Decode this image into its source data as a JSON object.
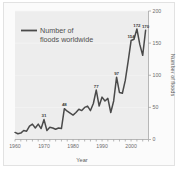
{
  "chart_data": {
    "type": "line",
    "title": "",
    "xlabel": "Year",
    "ylabel": "Number of floods",
    "xlim": [
      1960,
      2006
    ],
    "ylim": [
      0,
      200
    ],
    "grid": false,
    "legend_position": "top-left",
    "legend": [
      "Number of floods worldwide"
    ],
    "legend_line1": "Number of",
    "legend_line2": "floods worldwide",
    "xticks": [
      "1960",
      "1970",
      "1980",
      "1990",
      "2000"
    ],
    "xtick_values": [
      1960,
      1970,
      1980,
      1990,
      2000
    ],
    "yticks": [
      "0",
      "50",
      "100",
      "150",
      "200"
    ],
    "ytick_values": [
      0,
      50,
      100,
      150,
      200
    ],
    "series": [
      {
        "name": "Number of floods worldwide",
        "color": "#4a4a4a",
        "x": [
          1960,
          1961,
          1962,
          1963,
          1964,
          1965,
          1966,
          1967,
          1968,
          1969,
          1970,
          1971,
          1972,
          1973,
          1974,
          1975,
          1976,
          1977,
          1978,
          1979,
          1980,
          1981,
          1982,
          1983,
          1984,
          1985,
          1986,
          1987,
          1988,
          1989,
          1990,
          1991,
          1992,
          1993,
          1994,
          1995,
          1996,
          1997,
          1998,
          1999,
          2000,
          2001,
          2002,
          2003,
          2004,
          2005
        ],
        "values": [
          11,
          9,
          10,
          14,
          13,
          21,
          24,
          18,
          24,
          17,
          31,
          14,
          19,
          18,
          16,
          18,
          17,
          48,
          44,
          41,
          38,
          42,
          47,
          45,
          50,
          52,
          45,
          56,
          77,
          52,
          66,
          60,
          64,
          42,
          60,
          97,
          73,
          72,
          92,
          122,
          154,
          156,
          172,
          148,
          131,
          170
        ]
      }
    ],
    "point_labels": [
      {
        "year": 1970,
        "value": 31,
        "text": "31"
      },
      {
        "year": 1977,
        "value": 48,
        "text": "48"
      },
      {
        "year": 1988,
        "value": 77,
        "text": "77"
      },
      {
        "year": 1995,
        "value": 97,
        "text": "97"
      },
      {
        "year": 2000,
        "value": 154,
        "text": "154"
      },
      {
        "year": 2002,
        "value": 172,
        "text": "172"
      },
      {
        "year": 2005,
        "value": 170,
        "text": "170"
      }
    ],
    "colors": {
      "line": "#4a4a4a",
      "plot_background": "#ededed",
      "axis": "#9a9a9a",
      "text": "#6d6d6d",
      "card_background": "#fbfbfb",
      "card_border": "#e2e2e2"
    }
  }
}
